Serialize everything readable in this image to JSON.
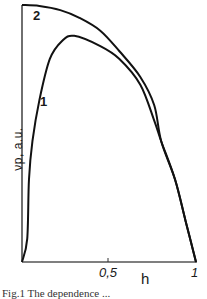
{
  "chart_data": {
    "type": "line",
    "title": "",
    "xlabel": "h",
    "ylabel": "νp, a.u.",
    "xlim": [
      0,
      1
    ],
    "ylim": [
      0,
      1
    ],
    "x_ticks": [
      {
        "value": 0.5,
        "label": "0.5"
      },
      {
        "value": 1,
        "label": "1"
      }
    ],
    "grid": false,
    "legend": "inline curve labels",
    "series": [
      {
        "name": "1",
        "x": [
          0,
          0.03,
          0.04,
          0.06,
          0.1,
          0.16,
          0.23,
          0.3,
          0.45,
          0.56,
          0.68,
          0.76,
          0.8,
          0.88,
          0.94,
          1.0
        ],
        "y": [
          0,
          0.09,
          0.32,
          0.47,
          0.63,
          0.79,
          0.86,
          0.88,
          0.84,
          0.79,
          0.69,
          0.55,
          0.47,
          0.32,
          0.16,
          0
        ]
      },
      {
        "name": "2",
        "x": [
          0,
          0.1,
          0.22,
          0.33,
          0.45,
          0.56,
          0.68,
          0.76,
          0.8,
          0.88,
          0.94,
          1.0
        ],
        "y": [
          1.0,
          0.996,
          0.98,
          0.95,
          0.9,
          0.82,
          0.72,
          0.61,
          0.47,
          0.32,
          0.16,
          0
        ]
      }
    ]
  },
  "labels": {
    "curve1": "1",
    "curve2": "2",
    "tick_05": "0,5",
    "tick_1": "1",
    "xlabel": "h",
    "ylabel": "νp, a.u.",
    "caption": "Fig.1 The dependence ..."
  }
}
